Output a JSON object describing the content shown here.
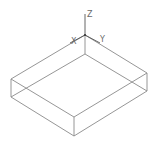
{
  "viewport": {
    "background": "#ffffff",
    "edge_color": "#8a8a8a",
    "axis_color": "#555555"
  },
  "ucs_icon": {
    "origin": [
      85,
      35
    ],
    "axes": [
      {
        "name": "Z",
        "label": "Z",
        "end": [
          85,
          14
        ],
        "label_pos": [
          87,
          17
        ]
      },
      {
        "name": "Y",
        "label": "Y",
        "end": [
          100,
          43
        ],
        "label_pos": [
          100,
          43
        ]
      },
      {
        "name": "X",
        "label": "X",
        "end": [
          70,
          43
        ],
        "label_pos": [
          71,
          44
        ]
      }
    ]
  },
  "box": {
    "vertices": {
      "top_back": [
        85,
        35
      ],
      "top_left": [
        11,
        79
      ],
      "top_front": [
        74,
        117
      ],
      "top_right": [
        147,
        73
      ],
      "bottom_back": [
        85,
        54
      ],
      "bottom_left": [
        11,
        97
      ],
      "bottom_front": [
        74,
        136
      ],
      "bottom_right": [
        147,
        91
      ]
    }
  }
}
